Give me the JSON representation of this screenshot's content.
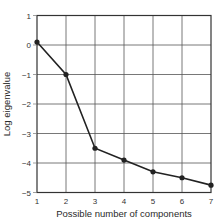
{
  "chart_data": {
    "type": "line",
    "title": "",
    "xlabel": "Possible number of components",
    "ylabel": "Log eigenvalue",
    "x": [
      1,
      2,
      3,
      4,
      5,
      6,
      7
    ],
    "series": [
      {
        "name": "Log eigenvalue",
        "values": [
          0.1,
          -1.0,
          -3.5,
          -3.9,
          -4.3,
          -4.5,
          -4.75
        ]
      }
    ],
    "xlim": [
      1,
      7
    ],
    "ylim": [
      -5,
      1
    ],
    "xticks": [
      "1",
      "2",
      "3",
      "4",
      "5",
      "6",
      "7"
    ],
    "yticks": [
      "1",
      "0",
      "-1",
      "-2",
      "-3",
      "-4",
      "-5"
    ],
    "grid": true,
    "legend": "none",
    "colors": {
      "line": "#222222",
      "grid": "#555555",
      "axis": "#333333"
    }
  }
}
